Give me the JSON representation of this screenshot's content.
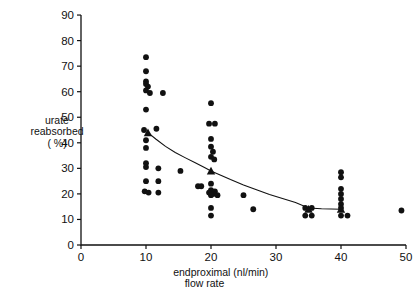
{
  "chart_data": {
    "type": "scatter",
    "title": "",
    "xlabel": "endproximal (nl/min) flow rate",
    "xlabel_line1": "endproximal (nl/min)",
    "xlabel_line2": "flow rate",
    "ylabel": "urate reabsorbed (%)",
    "ylabel_line1": "urate",
    "ylabel_line2": "reabsorbed",
    "ylabel_line3": "( %)",
    "xlim": [
      0,
      50
    ],
    "ylim": [
      0,
      90
    ],
    "xticks": [
      0,
      10,
      20,
      30,
      40,
      50
    ],
    "yticks": [
      0,
      10,
      20,
      30,
      40,
      50,
      60,
      70,
      80,
      90
    ],
    "xtick_labels": [
      "0",
      "10",
      "20",
      "30",
      "40",
      "50"
    ],
    "ytick_labels": [
      "0",
      "10",
      "20",
      "30",
      "40",
      "50",
      "60",
      "70",
      "80",
      "90"
    ],
    "grid": false,
    "legend": null,
    "series": [
      {
        "name": "individual measurements",
        "marker": "filled-circle",
        "color": "#111111",
        "points": [
          [
            10.0,
            73.5
          ],
          [
            10.0,
            68.0
          ],
          [
            10.0,
            64.0
          ],
          [
            10.0,
            63.0
          ],
          [
            10.3,
            62.0
          ],
          [
            10.0,
            60.5
          ],
          [
            10.6,
            59.5
          ],
          [
            12.6,
            59.5
          ],
          [
            10.0,
            53.0
          ],
          [
            9.7,
            45.0
          ],
          [
            11.6,
            45.5
          ],
          [
            10.0,
            41.0
          ],
          [
            10.0,
            38.0
          ],
          [
            10.0,
            32.0
          ],
          [
            10.0,
            30.5
          ],
          [
            11.9,
            30.0
          ],
          [
            10.0,
            25.0
          ],
          [
            11.9,
            25.0
          ],
          [
            9.8,
            21.0
          ],
          [
            10.4,
            20.5
          ],
          [
            11.9,
            20.5
          ],
          [
            15.3,
            29.0
          ],
          [
            18.0,
            23.0
          ],
          [
            20.0,
            55.5
          ],
          [
            19.7,
            47.5
          ],
          [
            20.6,
            47.5
          ],
          [
            20.0,
            41.5
          ],
          [
            20.0,
            38.5
          ],
          [
            20.3,
            36.5
          ],
          [
            20.0,
            34.5
          ],
          [
            20.5,
            33.5
          ],
          [
            20.0,
            24.0
          ],
          [
            18.5,
            23.0
          ],
          [
            20.0,
            21.5
          ],
          [
            20.6,
            21.0
          ],
          [
            19.7,
            20.5
          ],
          [
            20.3,
            20.0
          ],
          [
            20.0,
            19.5
          ],
          [
            21.0,
            19.5
          ],
          [
            20.0,
            14.5
          ],
          [
            20.0,
            11.5
          ],
          [
            25.0,
            19.5
          ],
          [
            26.5,
            14.0
          ],
          [
            34.5,
            14.5
          ],
          [
            35.5,
            14.5
          ],
          [
            34.5,
            11.5
          ],
          [
            35.5,
            11.5
          ],
          [
            40.0,
            28.5
          ],
          [
            40.0,
            26.5
          ],
          [
            40.0,
            22.0
          ],
          [
            40.0,
            20.0
          ],
          [
            40.0,
            18.0
          ],
          [
            40.0,
            16.0
          ],
          [
            40.0,
            14.5
          ],
          [
            40.0,
            11.5
          ],
          [
            41.0,
            11.5
          ],
          [
            49.3,
            13.5
          ]
        ]
      },
      {
        "name": "group means",
        "marker": "filled-triangle",
        "color": "#111111",
        "points": [
          [
            10.3,
            44.0
          ],
          [
            20.0,
            29.0
          ],
          [
            35.0,
            14.0
          ],
          [
            40.0,
            14.0
          ]
        ]
      }
    ],
    "fit_curve": {
      "name": "fitted decay curve",
      "color": "#111111",
      "points": [
        [
          10.3,
          44.0
        ],
        [
          11.5,
          41.5
        ],
        [
          13.0,
          38.6
        ],
        [
          14.5,
          36.2
        ],
        [
          16.0,
          34.2
        ],
        [
          17.5,
          32.3
        ],
        [
          19.0,
          30.3
        ],
        [
          20.0,
          29.0
        ],
        [
          21.5,
          27.3
        ],
        [
          23.0,
          25.6
        ],
        [
          25.0,
          23.5
        ],
        [
          27.0,
          21.6
        ],
        [
          29.0,
          19.8
        ],
        [
          31.0,
          18.2
        ],
        [
          33.0,
          16.6
        ],
        [
          35.0,
          14.5
        ],
        [
          37.0,
          14.2
        ],
        [
          40.0,
          14.0
        ]
      ]
    }
  }
}
